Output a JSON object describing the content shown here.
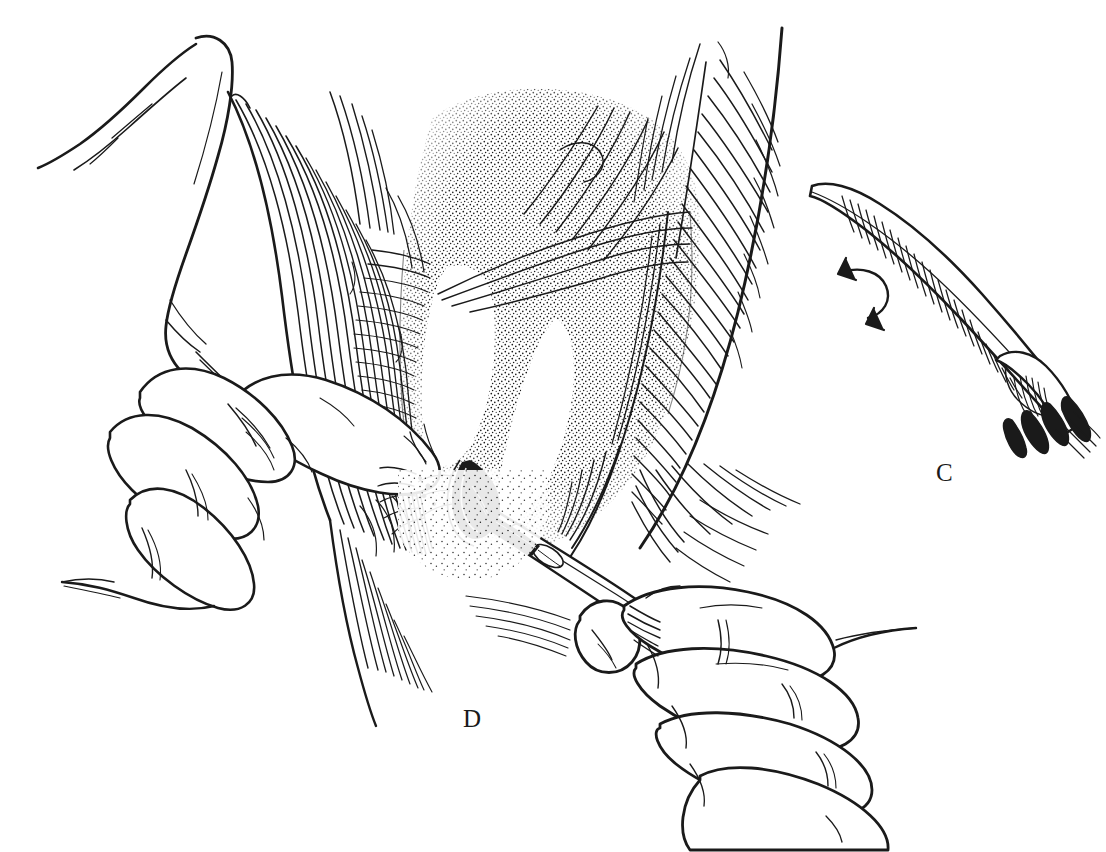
{
  "figure": {
    "background_color": "#ffffff",
    "ink_color": "#111111",
    "width": 1106,
    "height": 852,
    "style": "pen-and-ink line drawing with hatching and stipple shading"
  },
  "labels": {
    "panel_c": "C",
    "panel_d": "D"
  },
  "panels": [
    {
      "id": "C",
      "label": "C",
      "label_x": 946,
      "label_y": 478,
      "content": "surgical rake retractor instrument shown alone, angled from upper left to lower right, with four curved prongs at its working end and a curved rotation arrow beside the shaft"
    },
    {
      "id": "D",
      "label": "D",
      "label_x": 473,
      "label_y": 723,
      "content": "operative field: two gloved hands retract tissue edges while a scalpel held in the right hand incises the stippled deep tissue between hatched muscle bellies"
    }
  ],
  "elements": {
    "instrument_c": {
      "name": "rake-retractor",
      "prong_count": 4,
      "rotation_arrow": "curved arrow indicating rotation of instrument"
    },
    "scalpel": {
      "name": "scalpel",
      "blade": "dark triangular blade at incision point",
      "handle": "long slender handle running to lower right"
    },
    "left_hand": {
      "name": "left-hand",
      "visible_digits": 4,
      "action": "retracting tissue edge"
    },
    "right_hand": {
      "name": "right-hand",
      "visible_digits": 4,
      "action": "holding scalpel in pencil grip"
    },
    "upper_left_digit": {
      "name": "upper-left-finger",
      "action": "retracting upper tissue flap"
    },
    "tissue": {
      "left_muscle": "longitudinally hatched muscle belly, left of midline",
      "right_muscle": "densely hatched muscle belly, right of midline",
      "deep_field": "stippled deep tissue plane in center",
      "incision": "incision line at scalpel blade tip"
    }
  }
}
